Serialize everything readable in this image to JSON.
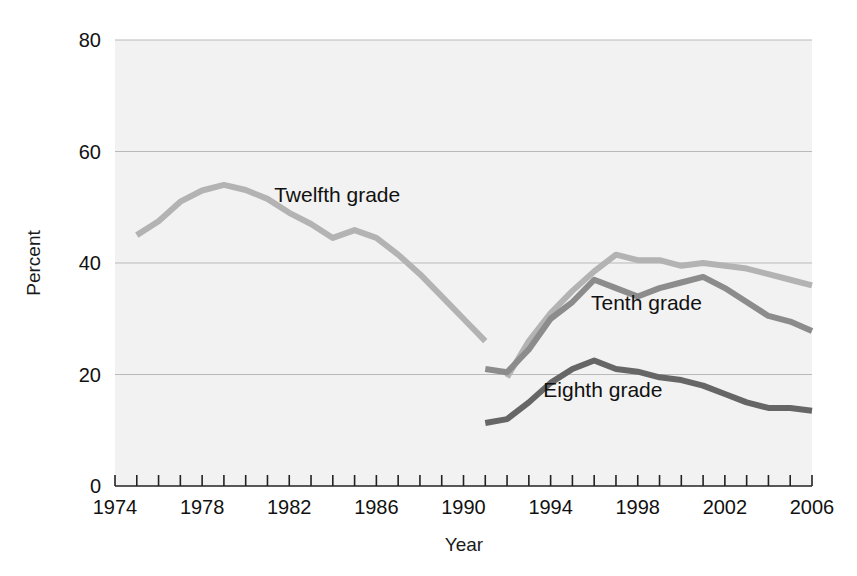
{
  "chart_data": {
    "type": "line",
    "title": "",
    "xlabel": "Year",
    "ylabel": "Percent",
    "xlim": [
      1974,
      2006
    ],
    "ylim": [
      0,
      80
    ],
    "yticks": [
      0,
      20,
      40,
      60,
      80
    ],
    "ytick_labels": [
      "0",
      "20",
      "40",
      "60",
      "80"
    ],
    "xticks": [
      1974,
      1978,
      1982,
      1986,
      1990,
      1994,
      1998,
      2002,
      2006
    ],
    "xtick_labels": [
      "1974",
      "1978",
      "1982",
      "1986",
      "1990",
      "1994",
      "1998",
      "2002",
      "2006"
    ],
    "x_minor_tick_interval": 1,
    "grid": "horizontal",
    "legend_position": "inline-annotations",
    "plot_background": "#f2f2f2",
    "series": [
      {
        "name": "Twelfth grade",
        "color": "#b3b3b3",
        "label_x": 1984.2,
        "label_y": 51.0,
        "x": [
          1975,
          1976,
          1977,
          1978,
          1979,
          1980,
          1981,
          1982,
          1983,
          1984,
          1985,
          1986,
          1987,
          1988,
          1989,
          1990,
          1991
        ],
        "values": [
          45.0,
          47.5,
          51.0,
          53.0,
          54.0,
          53.1,
          51.5,
          49.0,
          47.0,
          44.5,
          45.9,
          44.5,
          41.5,
          38.0,
          34.0,
          30.0,
          26.0
        ]
      },
      {
        "name": "Twelfth grade (revised)",
        "color": "#b3b3b3",
        "x": [
          1992,
          1993,
          1994,
          1995,
          1996,
          1997,
          1998,
          1999,
          2000,
          2001,
          2002,
          2003,
          2004,
          2005,
          2006
        ],
        "values": [
          19.5,
          26.0,
          31.0,
          35.0,
          38.5,
          41.5,
          40.5,
          40.5,
          39.5,
          40.0,
          39.5,
          39.0,
          38.0,
          37.0,
          36.0
        ]
      },
      {
        "name": "Tenth grade",
        "color": "#8c8c8c",
        "label_x": 1998.4,
        "label_y": 31.5,
        "x": [
          1991,
          1992,
          1993,
          1994,
          1995,
          1996,
          1997,
          1998,
          1999,
          2000,
          2001,
          2002,
          2003,
          2004,
          2005,
          2006
        ],
        "values": [
          21.0,
          20.4,
          24.5,
          30.0,
          33.0,
          37.0,
          35.5,
          34.0,
          35.5,
          36.5,
          37.5,
          35.5,
          33.0,
          30.5,
          29.5,
          27.8
        ]
      },
      {
        "name": "Eighth grade",
        "color": "#666666",
        "label_x": 1996.4,
        "label_y": 16.0,
        "x": [
          1991,
          1992,
          1993,
          1994,
          1995,
          1996,
          1997,
          1998,
          1999,
          2000,
          2001,
          2002,
          2003,
          2004,
          2005,
          2006
        ],
        "values": [
          11.3,
          12.0,
          15.0,
          18.5,
          21.0,
          22.5,
          21.0,
          20.5,
          19.5,
          19.0,
          18.0,
          16.5,
          15.0,
          14.0,
          14.0,
          13.5
        ]
      }
    ],
    "annotations": [
      {
        "text": "Twelfth grade",
        "x": 1984.2,
        "y": 51.0
      },
      {
        "text": "Tenth grade",
        "x": 1998.4,
        "y": 31.5
      },
      {
        "text": "Eighth grade",
        "x": 1996.4,
        "y": 16.0
      }
    ]
  }
}
